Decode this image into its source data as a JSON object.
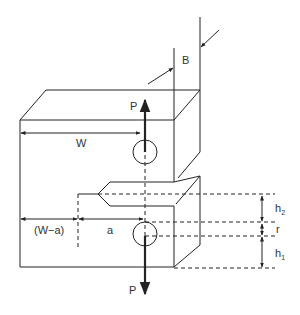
{
  "diagram": {
    "labels": {
      "thickness": "B",
      "width": "W",
      "load_top": "P",
      "load_bottom": "P",
      "ligament": "(W−a)",
      "crack_length": "a",
      "h2_base": "h",
      "h2_sub": "2",
      "radius": "r",
      "h1_base": "h",
      "h1_sub": "1"
    },
    "colors": {
      "line": "#222222",
      "text": "#333333",
      "background": "#ffffff"
    }
  }
}
